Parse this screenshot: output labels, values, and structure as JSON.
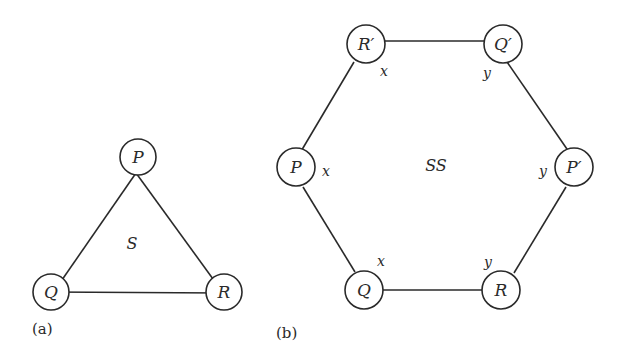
{
  "panels": [
    {
      "id": "a",
      "caption": "(a)",
      "region_label": "S",
      "nodes": [
        {
          "id": "P",
          "label": "P"
        },
        {
          "id": "Q",
          "label": "Q"
        },
        {
          "id": "R",
          "label": "R"
        }
      ],
      "edges": [
        [
          "P",
          "Q"
        ],
        [
          "P",
          "R"
        ],
        [
          "Q",
          "R"
        ]
      ]
    },
    {
      "id": "b",
      "caption": "(b)",
      "region_label": "SS",
      "nodes": [
        {
          "id": "R'",
          "label": "R′",
          "side": "x"
        },
        {
          "id": "Q'",
          "label": "Q′",
          "side": "y"
        },
        {
          "id": "P",
          "label": "P",
          "side": "x"
        },
        {
          "id": "P'",
          "label": "P′",
          "side": "y"
        },
        {
          "id": "Q",
          "label": "Q",
          "side": "x"
        },
        {
          "id": "R",
          "label": "R",
          "side": "y"
        }
      ],
      "edges": [
        [
          "R'",
          "Q'"
        ],
        [
          "Q'",
          "P'"
        ],
        [
          "P'",
          "R"
        ],
        [
          "R",
          "Q"
        ],
        [
          "Q",
          "P"
        ],
        [
          "P",
          "R'"
        ]
      ]
    }
  ]
}
